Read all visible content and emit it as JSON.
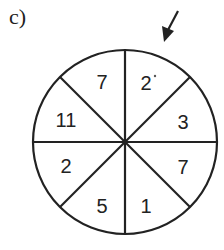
{
  "figure_label": "c)",
  "spinner": {
    "sections": [
      {
        "position": "top-right",
        "value": "2"
      },
      {
        "position": "right-upper",
        "value": "3"
      },
      {
        "position": "right-lower",
        "value": "7"
      },
      {
        "position": "bottom-right",
        "value": "1"
      },
      {
        "position": "bottom-left",
        "value": "5"
      },
      {
        "position": "left-lower",
        "value": "2"
      },
      {
        "position": "left-upper",
        "value": "11"
      },
      {
        "position": "top-left",
        "value": "7"
      }
    ],
    "pointer": "arrow-pointing-at-top-right-section"
  }
}
